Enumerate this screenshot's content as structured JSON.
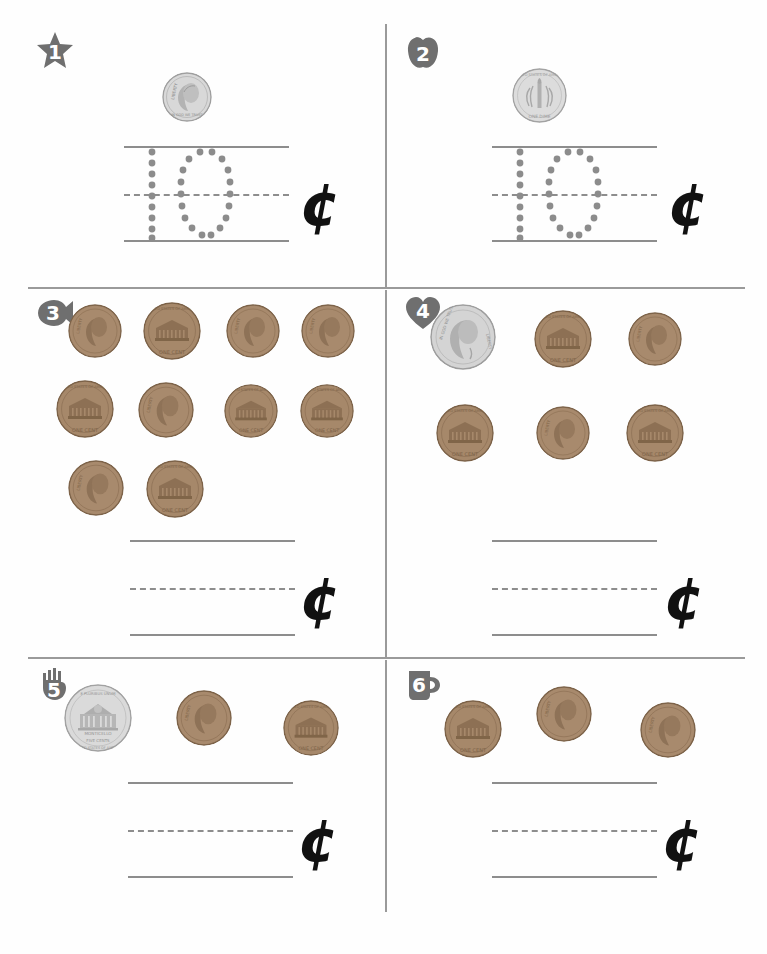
{
  "worksheet": {
    "title": "Counting Coins Worksheet",
    "cent_symbol": "¢",
    "colors": {
      "badge_fill": "#6f6f6f",
      "line": "#8d8d8d",
      "divider": "#9a9a9a",
      "trace_dot": "#8c8c8c",
      "penny": "#a9896b",
      "silver": "#c9c9c9"
    }
  },
  "problems": [
    {
      "id": 1,
      "badge": {
        "number": "1",
        "shape": "star-badge"
      },
      "coins": [
        {
          "type": "dime",
          "side": "heads",
          "label": "LIBERTY"
        }
      ],
      "answer": {
        "traced": "10",
        "is_traced": true
      },
      "cent": "¢"
    },
    {
      "id": 2,
      "badge": {
        "number": "2",
        "shape": "apple-badge"
      },
      "coins": [
        {
          "type": "dime",
          "side": "tails",
          "label": "ONE DIME"
        }
      ],
      "answer": {
        "traced": "10",
        "is_traced": true
      },
      "cent": "¢"
    },
    {
      "id": 3,
      "badge": {
        "number": "3",
        "shape": "fish-badge"
      },
      "coins": [
        {
          "type": "penny",
          "side": "heads",
          "label": "LIBERTY"
        },
        {
          "type": "penny",
          "side": "tails",
          "label": "ONE CENT"
        },
        {
          "type": "penny",
          "side": "heads",
          "label": "LIBERTY"
        },
        {
          "type": "penny",
          "side": "heads",
          "label": "LIBERTY"
        },
        {
          "type": "penny",
          "side": "tails",
          "label": "ONE CENT"
        },
        {
          "type": "penny",
          "side": "heads",
          "label": "LIBERTY"
        },
        {
          "type": "penny",
          "side": "tails",
          "label": "ONE CENT"
        },
        {
          "type": "penny",
          "side": "tails",
          "label": "ONE CENT"
        },
        {
          "type": "penny",
          "side": "heads",
          "label": "LIBERTY"
        },
        {
          "type": "penny",
          "side": "tails",
          "label": "ONE CENT"
        }
      ],
      "answer": {
        "traced": "",
        "is_traced": false
      },
      "cent": "¢"
    },
    {
      "id": 4,
      "badge": {
        "number": "4",
        "shape": "heart-badge"
      },
      "coins": [
        {
          "type": "nickel",
          "side": "heads",
          "label": "LIBERTY"
        },
        {
          "type": "penny",
          "side": "tails",
          "label": "ONE CENT"
        },
        {
          "type": "penny",
          "side": "heads",
          "label": "LIBERTY"
        },
        {
          "type": "penny",
          "side": "tails",
          "label": "ONE CENT"
        },
        {
          "type": "penny",
          "side": "heads",
          "label": "LIBERTY"
        },
        {
          "type": "penny",
          "side": "tails",
          "label": "ONE CENT"
        }
      ],
      "answer": {
        "traced": "",
        "is_traced": false
      },
      "cent": "¢"
    },
    {
      "id": 5,
      "badge": {
        "number": "5",
        "shape": "hand-badge"
      },
      "coins": [
        {
          "type": "nickel",
          "side": "tails",
          "label": "MONTICELLO FIVE CENTS"
        },
        {
          "type": "penny",
          "side": "heads",
          "label": "LIBERTY"
        },
        {
          "type": "penny",
          "side": "tails",
          "label": "ONE CENT"
        }
      ],
      "answer": {
        "traced": "",
        "is_traced": false
      },
      "cent": "¢"
    },
    {
      "id": 6,
      "badge": {
        "number": "6",
        "shape": "mug-badge"
      },
      "coins": [
        {
          "type": "penny",
          "side": "tails",
          "label": "ONE CENT"
        },
        {
          "type": "penny",
          "side": "heads",
          "label": "LIBERTY"
        },
        {
          "type": "penny",
          "side": "heads",
          "label": "LIBERTY"
        }
      ],
      "answer": {
        "traced": "",
        "is_traced": false
      },
      "cent": "¢"
    }
  ]
}
